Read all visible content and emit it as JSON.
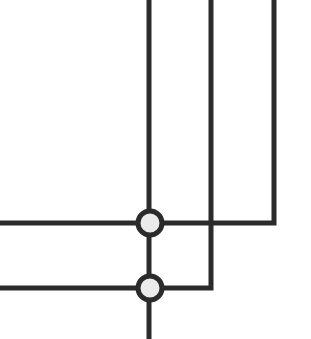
{
  "diagram": {
    "type": "wiring-junction",
    "colors": {
      "background": "#ffffff",
      "line": "#2b2b2b",
      "node_fill": "#ebebeb"
    },
    "line_width": 5,
    "lines": [
      {
        "id": "vertical-main",
        "points": [
          [
            149,
            0
          ],
          [
            149,
            339
          ]
        ]
      },
      {
        "id": "vertical-middle-to-lower-left",
        "points": [
          [
            211,
            0
          ],
          [
            211,
            288
          ],
          [
            0,
            288
          ]
        ]
      },
      {
        "id": "vertical-right-to-upper-left",
        "points": [
          [
            274,
            0
          ],
          [
            274,
            223
          ],
          [
            0,
            223
          ]
        ]
      }
    ],
    "nodes": [
      {
        "id": "junction-upper",
        "cx": 150,
        "cy": 223,
        "r": 12
      },
      {
        "id": "junction-lower",
        "cx": 150,
        "cy": 288,
        "r": 12
      }
    ]
  }
}
